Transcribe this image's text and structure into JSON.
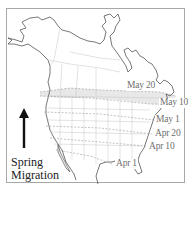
{
  "map": {
    "region": "North America",
    "shaded_band_color": "#e6e6e6",
    "border_color": "#a8a8a8",
    "coast_color": "#555555",
    "state_line_color": "#c0c0c0",
    "isolines": [
      {
        "label": "May 20",
        "x": 127,
        "y": 85
      },
      {
        "label": "May 10",
        "x": 158,
        "y": 102
      },
      {
        "label": "May 1",
        "x": 154,
        "y": 119
      },
      {
        "label": "Apr 20",
        "x": 153,
        "y": 133
      },
      {
        "label": "Apr 10",
        "x": 147,
        "y": 146
      },
      {
        "label": "Apr 1",
        "x": 114,
        "y": 163
      }
    ]
  },
  "legend": {
    "arrow_icon": "up-arrow",
    "line1": "Spring",
    "line2": "Migration"
  }
}
